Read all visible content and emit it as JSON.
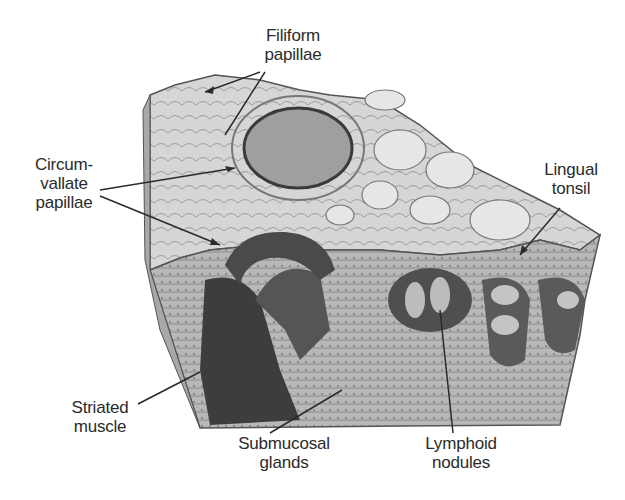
{
  "diagram": {
    "labels": [
      {
        "id": "filiform",
        "lines": [
          "Filiform",
          "papillae"
        ]
      },
      {
        "id": "circumvallate",
        "lines": [
          "Circum-",
          "vallate",
          "papillae"
        ]
      },
      {
        "id": "lingual-tonsil",
        "lines": [
          "Lingual",
          "tonsil"
        ]
      },
      {
        "id": "striated-muscle",
        "lines": [
          "Striated",
          "muscle"
        ]
      },
      {
        "id": "submucosal-glands",
        "lines": [
          "Submucosal",
          "glands"
        ]
      },
      {
        "id": "lymphoid-nodules",
        "lines": [
          "Lymphoid",
          "nodules"
        ]
      }
    ],
    "colors": {
      "background": "#ffffff",
      "text": "#2b2b2b",
      "leader": "#2b2b2b",
      "tissue_light": "#d9d9d9",
      "tissue_mid": "#9a9a9a",
      "tissue_dark": "#3a3a3a"
    }
  }
}
